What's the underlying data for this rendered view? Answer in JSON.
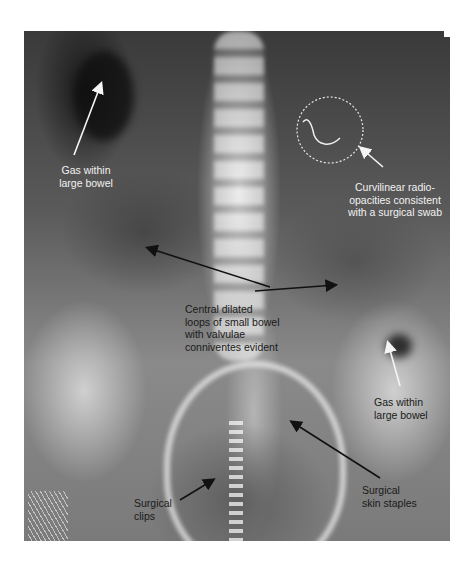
{
  "figure": {
    "annotations": [
      {
        "id": "gas-large-bowel-upper",
        "text": "Gas within\nlarge bowel"
      },
      {
        "id": "surgical-swab",
        "text": "Curvilinear radio-\nopacities consistent\nwith a surgical swab"
      },
      {
        "id": "small-bowel-loops",
        "text": "Central dilated\nloops of small bowel\nwith valvulae\nconniventes evident"
      },
      {
        "id": "gas-large-bowel-lower",
        "text": "Gas within\nlarge bowel"
      },
      {
        "id": "surgical-clips",
        "text": "Surgical\nclips"
      },
      {
        "id": "skin-staples",
        "text": "Surgical\nskin staples"
      }
    ],
    "colors": {
      "light_annotation": "#f2f2f2",
      "dark_annotation": "#1a1a1a",
      "swab_circle": "#e8e8e8",
      "background": "#ffffff"
    }
  }
}
